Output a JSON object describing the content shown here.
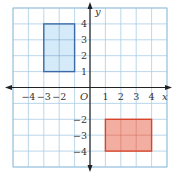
{
  "chart_data": {
    "type": "coordinate-grid",
    "title": "",
    "xlabel": "x",
    "ylabel": "y",
    "origin_label": "O",
    "xlim": [
      -5,
      5
    ],
    "ylim": [
      -5,
      5
    ],
    "grid": true,
    "x_ticks": [
      {
        "value": -4,
        "label": "−4"
      },
      {
        "value": -3,
        "label": "−3"
      },
      {
        "value": -2,
        "label": "−2"
      },
      {
        "value": 1,
        "label": "1"
      },
      {
        "value": 2,
        "label": "2"
      },
      {
        "value": 3,
        "label": "3"
      },
      {
        "value": 4,
        "label": "4"
      }
    ],
    "y_ticks": [
      {
        "value": 4,
        "label": "4"
      },
      {
        "value": 3,
        "label": "3"
      },
      {
        "value": 2,
        "label": "2"
      },
      {
        "value": 1,
        "label": "1"
      },
      {
        "value": -2,
        "label": "−2"
      },
      {
        "value": -3,
        "label": "−3"
      },
      {
        "value": -4,
        "label": "−4"
      }
    ],
    "shapes": [
      {
        "name": "blue-rectangle",
        "x1": -3,
        "y1": 1,
        "x2": -1,
        "y2": 4,
        "fill": "#cfe8f8",
        "stroke": "#3a6aa8"
      },
      {
        "name": "red-rectangle",
        "x1": 1,
        "y1": -4,
        "x2": 4,
        "y2": -2,
        "fill": "#f0a090",
        "stroke": "#d9452b"
      }
    ]
  },
  "colors": {
    "grid": "#a9cde6",
    "grid_border": "#8fbcd9",
    "axis": "#222222"
  }
}
